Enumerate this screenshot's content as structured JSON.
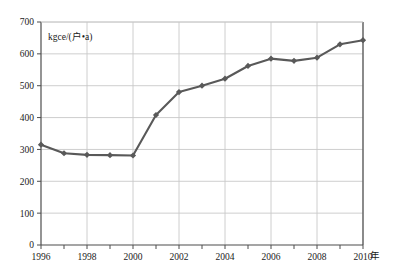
{
  "chart_data": {
    "type": "line",
    "title": "",
    "subtitle": "",
    "xlabel": "年",
    "ylabel": "kgce/(户•a)",
    "ylim": [
      0,
      700
    ],
    "xlim": [
      1996,
      2010
    ],
    "ytick_step": 100,
    "xtick_step": 1,
    "xlabel_step": 2,
    "grid": true,
    "grid_x": true,
    "grid_y": true,
    "legend": false,
    "legend_position": "none",
    "marker": "diamond",
    "series_color": "#595959",
    "grid_color": "#c8c8c8",
    "axis_color": "#4d4d4d",
    "background": "#ffffff",
    "yticks": [
      0,
      100,
      200,
      300,
      400,
      500,
      600,
      700
    ],
    "ytick_labels": [
      "0",
      "100",
      "200",
      "300",
      "400",
      "500",
      "600",
      "700"
    ],
    "xticks": [
      1996,
      1997,
      1998,
      1999,
      2000,
      2001,
      2002,
      2003,
      2004,
      2005,
      2006,
      2007,
      2008,
      2009,
      2010
    ],
    "xtick_labels": [
      "1996",
      "",
      "1998",
      "",
      "2000",
      "",
      "2002",
      "",
      "2004",
      "",
      "2006",
      "",
      "2008",
      "",
      "2010"
    ],
    "x": [
      1996,
      1997,
      1998,
      1999,
      2000,
      2001,
      2002,
      2003,
      2004,
      2005,
      2006,
      2007,
      2008,
      2009,
      2010
    ],
    "categories": [
      "1996",
      "1997",
      "1998",
      "1999",
      "2000",
      "2001",
      "2002",
      "2003",
      "2004",
      "2005",
      "2006",
      "2007",
      "2008",
      "2009",
      "2010"
    ],
    "values": [
      315,
      288,
      283,
      282,
      281,
      408,
      480,
      500,
      522,
      562,
      585,
      578,
      588,
      630,
      643
    ],
    "series": [
      {
        "name": "",
        "values": [
          315,
          288,
          283,
          282,
          281,
          408,
          480,
          500,
          522,
          562,
          585,
          578,
          588,
          630,
          643
        ]
      }
    ],
    "annotations": []
  },
  "labels": {
    "y_unit": "kgce/(户•a)",
    "x_unit": "年"
  }
}
